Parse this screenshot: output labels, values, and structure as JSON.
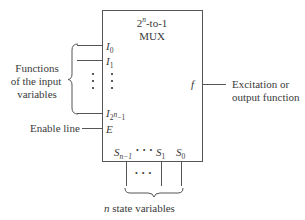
{
  "mux": {
    "title_line1_base": "2",
    "title_line1_sup": "n",
    "title_line1_rest": "-to-1",
    "title_line2": "MUX"
  },
  "inputs": {
    "i0_base": "I",
    "i0_sub": "0",
    "i1_base": "I",
    "i1_sub": "1",
    "ilast_base": "I",
    "ilast_sub_base": "2",
    "ilast_sub_sup": "n",
    "ilast_sub_rest": "−1",
    "enable_pin": "E",
    "dots": "•"
  },
  "selects": {
    "sn1_base": "S",
    "sn1_sub": "n−1",
    "s1_base": "S",
    "s1_sub": "1",
    "s0_base": "S",
    "s0_sub": "0",
    "dots": "• • •"
  },
  "output": {
    "pin": "f"
  },
  "labels": {
    "functions_line1": "Functions",
    "functions_line2": "of the input",
    "functions_line3": "variables",
    "enable_line": "Enable line",
    "excitation_line1": "Excitation or",
    "excitation_line2": "output function",
    "state_vars_n": "n",
    "state_vars_rest": " state variables"
  }
}
